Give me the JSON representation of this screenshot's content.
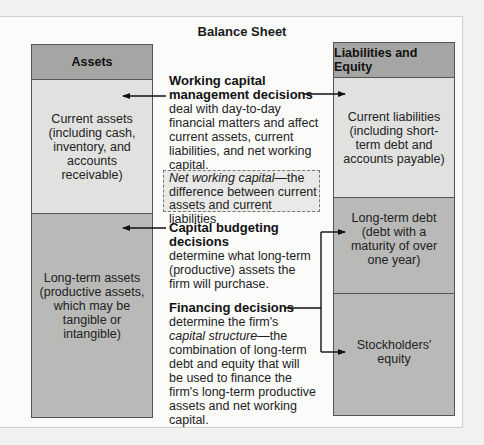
{
  "title": "Balance Sheet",
  "assets": {
    "header": "Assets",
    "current": "Current assets (including cash, inventory, and accounts receivable)",
    "long_term": "Long-term assets (productive assets, which may be tangible or intangible)"
  },
  "liabilities_equity": {
    "header": "Liabilities and Equity",
    "current": "Current liabilities (including short-term debt and accounts payable)",
    "long_term_debt": "Long-term debt (debt with a maturity of over one year)",
    "equity": "Stockholders' equity"
  },
  "decisions": {
    "working_capital": {
      "title": "Working capital management decisions",
      "body": "deal with day-to-day financial matters and affect current assets, current liabilities, and net working capital."
    },
    "net_working_capital": {
      "term": "Net working capital",
      "definition": "—the difference between current assets and current liabilities"
    },
    "capital_budgeting": {
      "title": "Capital budgeting decisions",
      "body": "determine what long-term (productive) assets the firm will purchase."
    },
    "financing": {
      "title": "Financing decisions",
      "body_pre": "determine the firm's",
      "term": "capital structure",
      "body_post": "—the combination of long-term debt and equity that will be used to finance the firm's long-term productive assets and net working capital."
    }
  },
  "colors": {
    "header_fill": "#a5a5a3",
    "light_fill": "#e1e1df",
    "dark_fill": "#b9b9b7",
    "line": "#111111"
  }
}
